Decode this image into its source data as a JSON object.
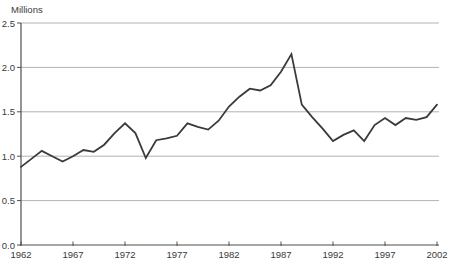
{
  "chart_data": {
    "type": "line",
    "title": "",
    "ylabel": "Millions",
    "xlabel": "",
    "legend": "none",
    "grid": "horizontal",
    "xlim": [
      1962,
      2002
    ],
    "ylim": [
      0,
      2.5
    ],
    "x_ticks": [
      1962,
      1967,
      1972,
      1977,
      1982,
      1987,
      1992,
      1997,
      2002
    ],
    "y_tick_labels": [
      "0.0",
      "0.5",
      "1.0",
      "1.5",
      "2.0",
      "2.5"
    ],
    "x": [
      1962,
      1963,
      1964,
      1965,
      1966,
      1967,
      1968,
      1969,
      1970,
      1971,
      1972,
      1973,
      1974,
      1975,
      1976,
      1977,
      1978,
      1979,
      1980,
      1981,
      1982,
      1983,
      1984,
      1985,
      1986,
      1987,
      1988,
      1989,
      1990,
      1991,
      1992,
      1993,
      1994,
      1995,
      1996,
      1997,
      1998,
      1999,
      2000,
      2001,
      2002
    ],
    "series": [
      {
        "name": "millions-series",
        "values": [
          0.88,
          0.97,
          1.06,
          1.0,
          0.94,
          1.0,
          1.07,
          1.05,
          1.13,
          1.26,
          1.37,
          1.26,
          0.98,
          1.18,
          1.2,
          1.23,
          1.37,
          1.33,
          1.3,
          1.4,
          1.56,
          1.67,
          1.76,
          1.74,
          1.8,
          1.95,
          2.15,
          1.58,
          1.44,
          1.31,
          1.17,
          1.24,
          1.29,
          1.17,
          1.35,
          1.43,
          1.35,
          1.43,
          1.41,
          1.44,
          1.58
        ]
      }
    ],
    "line_color": "#3a3a3a",
    "grid_color": "#b3b3b3",
    "axis_color": "#4f4f4f",
    "text_color": "#3a3a3a",
    "background_color": "#ffffff"
  }
}
